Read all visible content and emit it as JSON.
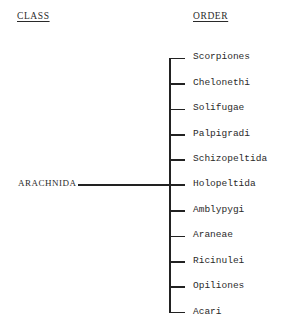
{
  "headers": {
    "class": "CLASS",
    "order": "ORDER"
  },
  "class_name": "ARACHNIDA",
  "orders": [
    "Scorpiones",
    "Chelonethi",
    "Solifugae",
    "Palpigradi",
    "Schizopeltida",
    "Holopeltida",
    "Amblypygi",
    "Araneae",
    "Ricinulei",
    "Opiliones",
    "Acari"
  ],
  "colors": {
    "line": "#222222",
    "text": "#2a2a2a",
    "background": "#ffffff"
  }
}
